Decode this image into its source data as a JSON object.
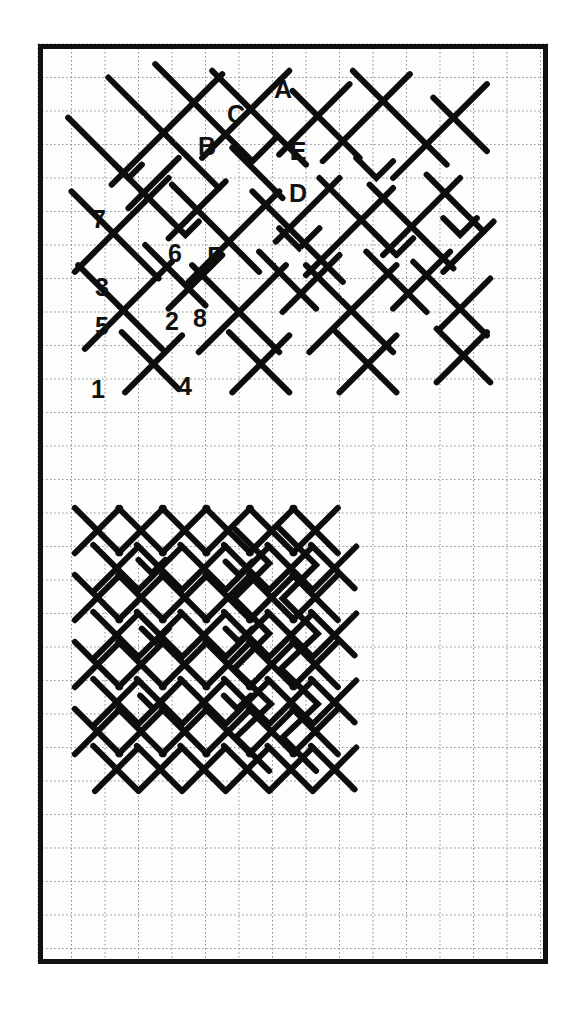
{
  "figure": {
    "background_color": "#ffffff",
    "paper_color": "#fdfdfb",
    "border_color": "#111111",
    "grid_color": "#9a9a9a",
    "stroke_color": "#111111",
    "frame": {
      "x": 38,
      "y": 44,
      "width": 510,
      "height": 920
    },
    "grid": {
      "origin_x": 38,
      "origin_y": 44,
      "spacing_x": 33.5,
      "spacing_y": 33.5,
      "cols": 15,
      "rows": 27,
      "style": "dashed"
    }
  },
  "labels": {
    "upper_letters": [
      {
        "id": "A",
        "text": "A",
        "x": 283,
        "y": 98
      },
      {
        "id": "C",
        "text": "C",
        "x": 236,
        "y": 123
      },
      {
        "id": "B",
        "text": "B",
        "x": 207,
        "y": 155
      },
      {
        "id": "E",
        "text": "E",
        "x": 298,
        "y": 160
      },
      {
        "id": "D",
        "text": "D",
        "x": 298,
        "y": 202
      },
      {
        "id": "F",
        "text": "F",
        "x": 215,
        "y": 265
      }
    ],
    "upper_numbers": [
      {
        "id": "7",
        "text": "7",
        "x": 99,
        "y": 228
      },
      {
        "id": "6",
        "text": "6",
        "x": 175,
        "y": 262
      },
      {
        "id": "3",
        "text": "3",
        "x": 102,
        "y": 296
      },
      {
        "id": "5",
        "text": "5",
        "x": 102,
        "y": 335
      },
      {
        "id": "2",
        "text": "2",
        "x": 172,
        "y": 330
      },
      {
        "id": "8",
        "text": "8",
        "x": 200,
        "y": 327
      },
      {
        "id": "1",
        "text": "1",
        "x": 98,
        "y": 398
      },
      {
        "id": "4",
        "text": "4",
        "x": 185,
        "y": 395
      }
    ]
  },
  "chart_data": {
    "type": "diagram",
    "units": "grid squares (33.5 px)",
    "upper_pattern": {
      "label_count": 14,
      "letters": [
        "A",
        "B",
        "C",
        "D",
        "E",
        "F"
      ],
      "numbers": [
        "1",
        "2",
        "3",
        "4",
        "5",
        "6",
        "7",
        "8"
      ],
      "bounds": {
        "x": 70,
        "y": 80,
        "width": 470,
        "height": 330
      }
    },
    "lower_pattern": {
      "bounds": {
        "x": 70,
        "y": 520,
        "width": 310,
        "height": 410
      },
      "labels": []
    }
  }
}
